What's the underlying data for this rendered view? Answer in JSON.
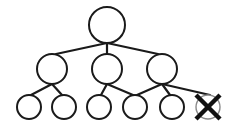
{
  "diagram": {
    "type": "tree",
    "stroke_color": "#1a1a1a",
    "removed_circle_color": "#8a8a8a",
    "cross_color": "#111111",
    "nodes": [
      {
        "id": "root",
        "x": 107,
        "y": 25,
        "r": 18,
        "level": 0,
        "removed": false
      },
      {
        "id": "m1",
        "x": 52,
        "y": 69,
        "r": 15,
        "level": 1,
        "removed": false
      },
      {
        "id": "m2",
        "x": 107,
        "y": 69,
        "r": 15,
        "level": 1,
        "removed": false
      },
      {
        "id": "m3",
        "x": 162,
        "y": 69,
        "r": 15,
        "level": 1,
        "removed": false
      },
      {
        "id": "b1",
        "x": 29,
        "y": 107,
        "r": 12,
        "level": 2,
        "removed": false
      },
      {
        "id": "b2",
        "x": 64,
        "y": 107,
        "r": 12,
        "level": 2,
        "removed": false
      },
      {
        "id": "b3",
        "x": 99,
        "y": 107,
        "r": 12,
        "level": 2,
        "removed": false
      },
      {
        "id": "b4",
        "x": 135,
        "y": 107,
        "r": 12,
        "level": 2,
        "removed": false
      },
      {
        "id": "b5",
        "x": 172,
        "y": 107,
        "r": 12,
        "level": 2,
        "removed": false
      },
      {
        "id": "b6",
        "x": 208,
        "y": 107,
        "r": 12,
        "level": 2,
        "removed": true
      }
    ],
    "edges": [
      {
        "from": "root",
        "to": "m1",
        "x1": 107,
        "y1": 43,
        "x2": 56,
        "y2": 54
      },
      {
        "from": "root",
        "to": "m2",
        "x1": 107,
        "y1": 43,
        "x2": 107,
        "y2": 54
      },
      {
        "from": "root",
        "to": "m3",
        "x1": 107,
        "y1": 43,
        "x2": 158,
        "y2": 54
      },
      {
        "from": "m1",
        "to": "b1",
        "x1": 52,
        "y1": 84,
        "x2": 31,
        "y2": 95
      },
      {
        "from": "m1",
        "to": "b2",
        "x1": 52,
        "y1": 84,
        "x2": 62,
        "y2": 95
      },
      {
        "from": "m2",
        "to": "b3",
        "x1": 107,
        "y1": 84,
        "x2": 101,
        "y2": 95
      },
      {
        "from": "m2",
        "to": "b4",
        "x1": 107,
        "y1": 84,
        "x2": 133,
        "y2": 95
      },
      {
        "from": "m3",
        "to": "b4",
        "x1": 162,
        "y1": 84,
        "x2": 137,
        "y2": 95
      },
      {
        "from": "m3",
        "to": "b5",
        "x1": 162,
        "y1": 84,
        "x2": 170,
        "y2": 95
      },
      {
        "from": "m3",
        "to": "b6",
        "x1": 162,
        "y1": 84,
        "x2": 210,
        "y2": 95
      }
    ]
  }
}
